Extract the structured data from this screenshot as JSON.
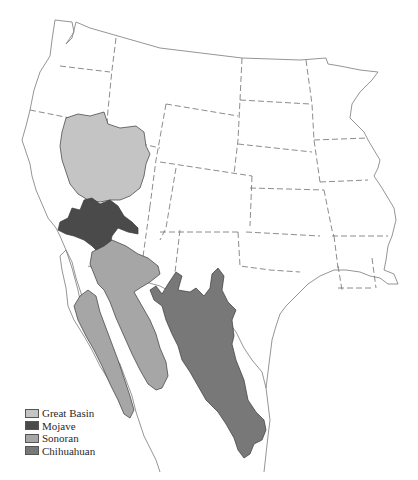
{
  "map": {
    "subject": "North American deserts",
    "regions": [
      {
        "name": "Great Basin",
        "color": "#c4c4c4"
      },
      {
        "name": "Mojave",
        "color": "#4a4a4a"
      },
      {
        "name": "Sonoran",
        "color": "#a6a6a6"
      },
      {
        "name": "Chihuahuan",
        "color": "#787878"
      }
    ]
  },
  "legend": {
    "items": [
      {
        "label": "Great Basin",
        "color": "#c4c4c4"
      },
      {
        "label": "Mojave",
        "color": "#4a4a4a"
      },
      {
        "label": "Sonoran",
        "color": "#a6a6a6"
      },
      {
        "label": "Chihuahuan",
        "color": "#787878"
      }
    ]
  }
}
